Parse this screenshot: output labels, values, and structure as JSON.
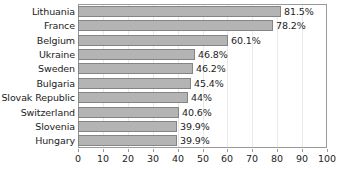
{
  "chart_data": {
    "type": "bar",
    "orientation": "horizontal",
    "title": "",
    "xlabel": "",
    "ylabel": "",
    "xlim": [
      0,
      100
    ],
    "xticks": [
      0,
      10,
      20,
      30,
      40,
      50,
      60,
      70,
      80,
      90,
      100
    ],
    "grid": true,
    "legend": false,
    "categories": [
      "Lithuania",
      "France",
      "Belgium",
      "Ukraine",
      "Sweden",
      "Bulgaria",
      "Slovak Republic",
      "Switzerland",
      "Slovenia",
      "Hungary"
    ],
    "values": [
      81.5,
      78.2,
      60.1,
      46.8,
      46.2,
      45.4,
      44,
      40.6,
      39.9,
      39.9
    ],
    "value_labels": [
      "81.5%",
      "78.2%",
      "60.1%",
      "46.8%",
      "46.2%",
      "45.4%",
      "44%",
      "40.6%",
      "39.9%",
      "39.9%"
    ],
    "tick_labels": [
      "0",
      "10",
      "20",
      "30",
      "40",
      "50",
      "60",
      "70",
      "80",
      "90",
      "100"
    ],
    "colors": {
      "bar_fill": "#b4b4b4",
      "bar_border": "#848484",
      "gridline": "#e9e9e9",
      "axis": "#9a9a9a",
      "text": "#1c1c1c",
      "background": "#ffffff"
    }
  }
}
